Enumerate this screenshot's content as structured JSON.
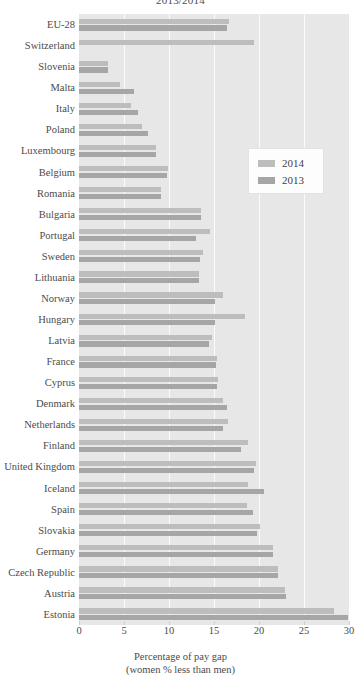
{
  "chart_data": {
    "type": "bar",
    "orientation": "horizontal",
    "title": "2013/2014",
    "xlabel": "Percentage of pay gap",
    "xlabel_line2": "(women % less than men)",
    "ylabel": "",
    "xlim": [
      0,
      30
    ],
    "xticks": [
      0,
      5,
      10,
      15,
      20,
      25,
      30
    ],
    "grid": true,
    "legend_position": "middle-right",
    "categories": [
      "EU-28",
      "Switzerland",
      "Slovenia",
      "Malta",
      "Italy",
      "Poland",
      "Luxembourg",
      "Belgium",
      "Romania",
      "Bulgaria",
      "Portugal",
      "Sweden",
      "Lithuania",
      "Norway",
      "Hungary",
      "Latvia",
      "France",
      "Cyprus",
      "Denmark",
      "Netherlands",
      "Finland",
      "United Kingdom",
      "Iceland",
      "Spain",
      "Slovakia",
      "Germany",
      "Czech Republic",
      "Austria",
      "Estonia"
    ],
    "series": [
      {
        "name": "2014",
        "color": "#bdbdbd",
        "values": [
          16.7,
          19.4,
          3.2,
          4.5,
          5.8,
          7.0,
          8.6,
          9.9,
          9.1,
          13.6,
          14.5,
          13.8,
          13.3,
          16.0,
          18.4,
          14.8,
          15.3,
          15.4,
          16.0,
          16.5,
          18.8,
          19.7,
          18.8,
          18.7,
          20.1,
          21.6,
          22.1,
          22.9,
          28.3
        ]
      },
      {
        "name": "2013",
        "color": "#a6a6a6",
        "values": [
          16.4,
          0,
          3.2,
          6.1,
          6.5,
          7.7,
          8.6,
          9.8,
          9.1,
          13.5,
          13.0,
          13.4,
          13.3,
          15.1,
          15.1,
          14.4,
          15.2,
          15.3,
          16.4,
          16.0,
          18.0,
          19.4,
          20.5,
          19.3,
          19.8,
          21.6,
          22.1,
          23.0,
          29.9
        ]
      }
    ]
  }
}
